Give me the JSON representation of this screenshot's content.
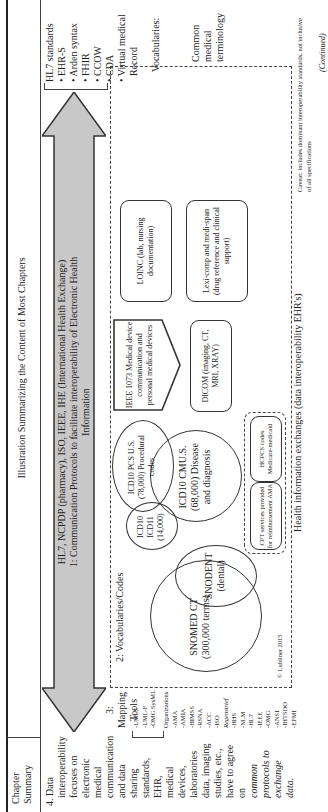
{
  "header": {
    "col1": "Chapter Summary",
    "title": "Illustration Summarizing the Content of Most Chapters"
  },
  "summary": {
    "lines": [
      "4. Data",
      "interoperability",
      "focuses on",
      "electronic",
      "medical",
      "communication",
      "and data sharing",
      "standards, EHR,",
      "medical devices,",
      "laboratories",
      "data, imaging",
      "studies, etc.,",
      "have to agree on"
    ],
    "italic_lines": [
      "common",
      "protocols to",
      "exchange data."
    ]
  },
  "mapping": {
    "title": "3: Mapping Tools",
    "tools": [
      "-UMLS",
      "-UML-F",
      "-OMG SysML"
    ],
    "org_title": "Organizations",
    "orgs": [
      "-AMA",
      "-AMIA",
      "-HIMSS",
      "-RSNA",
      "-ACC",
      "-ISO"
    ],
    "reg_title": "Regenstrief",
    "regs": [
      "-HHS",
      "-NLM",
      "-HL7",
      "-IEEE",
      "-OMG",
      "-ANSI",
      "-IHTSDO",
      "-EFMI"
    ]
  },
  "arrow": {
    "line1": "HL7, NCPDP (pharmacy), ISO, IEEE, IHE (International Health Exchange)",
    "line2": "1: Communication Protocols to facilitate interoperability of Electronic Health",
    "line3": "Information",
    "fill": "#c8c8c8"
  },
  "hl7": {
    "title": "HL7 standards",
    "items": [
      "• EHR-S",
      "• Arden syntax",
      "• FHIR",
      "• CCOW",
      "• CDA",
      "• Virtual medical",
      "  Record"
    ]
  },
  "vocab": {
    "section_label": "2: Vocabularies/Codes",
    "snomed": "SNOMED CT (300,000 terms)",
    "snodent": "SNODENT (dental)",
    "icd10_11": "ICD10 ICD11 (14,000)",
    "icd10cm": "ICD10 CMU.S. (68,000) Disease and diagnosis",
    "icd10pcs": "ICD10 PCS U.S. (78,000) Procedural codes",
    "ieee": "IEEE 1073 Medical device communication and personal medical devices",
    "dicom": "DICOM (imaging, CT, MRI, XRAY)",
    "loinc": "LOINC (lab, nursing documentation)",
    "lexi": "Lexi-comp and medi-span (drug reference and clinical support)",
    "cpt": "CPT services provided for reimbursement AMA",
    "hcpcs": "HCPCS codes Medicare-medicaid",
    "copyright": "© Lubliner 2015",
    "footer": "Health information exchanges (data interoperability EHR's)",
    "right_title": "Vocabularies:",
    "right_sub": "Common medical terminology",
    "caveat": "Caveat: includes dominant interoperability standards, not inclusive of all specifications"
  },
  "continued": "(Continued)"
}
